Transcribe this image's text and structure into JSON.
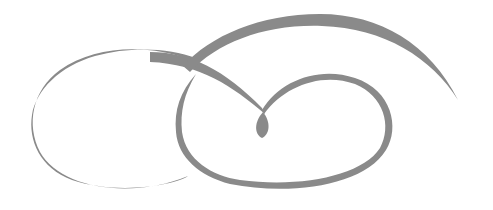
{
  "image": {
    "subject": "decorative calligraphic flourish ornament",
    "background": "#ffffff",
    "ink_color": "#8a8a8a"
  }
}
